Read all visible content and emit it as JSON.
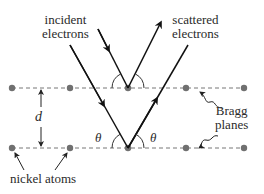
{
  "labels": {
    "incident_line1": "incident",
    "incident_line2": "electrons",
    "scattered_line1": "scattered",
    "scattered_line2": "electrons",
    "spacing": "d",
    "theta_left": "θ",
    "theta_right": "θ",
    "bragg_line1": "Bragg",
    "bragg_line2": "planes",
    "atoms": "nickel atoms"
  },
  "colors": {
    "beam": "#111111",
    "atom": "#707070",
    "plane": "#777777",
    "text": "#2a2a2a"
  },
  "geometry": {
    "upper_plane_y": 88,
    "lower_plane_y": 148,
    "atom_x": [
      12,
      70,
      128,
      186,
      244
    ]
  }
}
